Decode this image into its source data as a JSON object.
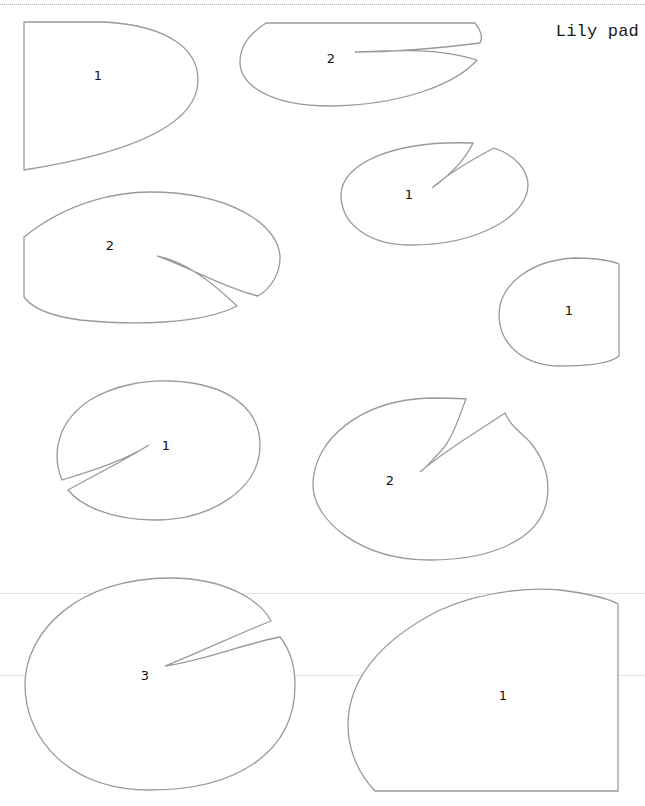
{
  "page": {
    "title": "Lily pad"
  },
  "outline_color": "#9a9a9a",
  "pieces": [
    {
      "id": "piece-a",
      "label": "1",
      "position": "top-left"
    },
    {
      "id": "piece-b",
      "label": "2",
      "position": "top-center"
    },
    {
      "id": "piece-c",
      "label": "1",
      "position": "upper-right"
    },
    {
      "id": "piece-d",
      "label": "2",
      "position": "middle-left"
    },
    {
      "id": "piece-e",
      "label": "1",
      "position": "middle-right-edge"
    },
    {
      "id": "piece-f",
      "label": "1",
      "position": "lower-left"
    },
    {
      "id": "piece-g",
      "label": "2",
      "position": "lower-center"
    },
    {
      "id": "piece-h",
      "label": "3",
      "position": "bottom-left"
    },
    {
      "id": "piece-i",
      "label": "1",
      "position": "bottom-right"
    }
  ]
}
